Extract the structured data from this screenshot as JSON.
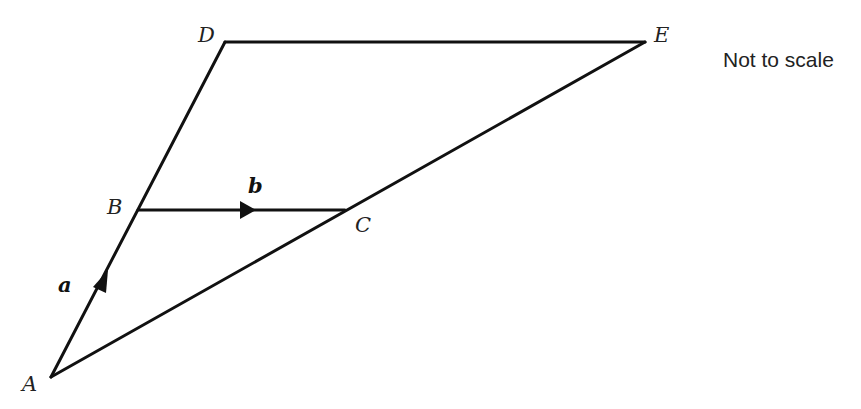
{
  "diagram": {
    "note": "Not to scale",
    "points": [
      {
        "id": "A",
        "label": "A"
      },
      {
        "id": "B",
        "label": "B"
      },
      {
        "id": "C",
        "label": "C"
      },
      {
        "id": "D",
        "label": "D"
      },
      {
        "id": "E",
        "label": "E"
      }
    ],
    "segments": [
      {
        "from": "A",
        "to": "D"
      },
      {
        "from": "D",
        "to": "E"
      },
      {
        "from": "E",
        "to": "A"
      },
      {
        "from": "B",
        "to": "C"
      }
    ],
    "vectors": [
      {
        "label": "a",
        "from": "A",
        "to": "B"
      },
      {
        "label": "b",
        "from": "B",
        "to": "C"
      }
    ]
  }
}
